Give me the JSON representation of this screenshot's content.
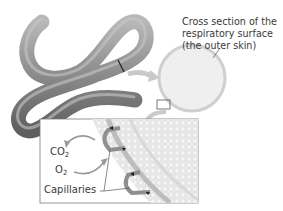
{
  "diagram": {
    "labels": {
      "cross_section": [
        "Cross section of the",
        "respiratory surface",
        "(the outer skin)"
      ],
      "co2": {
        "base": "CO",
        "sub": "2"
      },
      "o2": {
        "base": "O",
        "sub": "2"
      },
      "capillaries": "Capillaries"
    },
    "colors": {
      "worm_dark": "#5e5e5e",
      "worm_mid": "#8a8a8a",
      "worm_light": "#b8b8b8",
      "arrow": "#c9c9c9",
      "circle_fill": "#efefef",
      "circle_edge": "#cfcfcf",
      "inset_border": "#7a7a7a",
      "tissue": "#e4e4e4",
      "vessel": "#9a9a9a",
      "text": "#3a3a3a"
    }
  }
}
